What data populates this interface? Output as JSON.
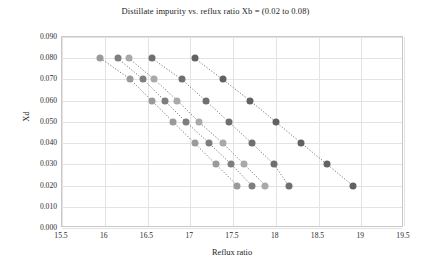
{
  "chart_data": {
    "type": "scatter",
    "title": "Distillate impurity vs. reflux ratio Xb = (0.02 to 0.08)",
    "xlabel": "Reflux ratio",
    "ylabel": "Xd",
    "xlim": [
      15.5,
      19.5
    ],
    "ylim": [
      0.0,
      0.09
    ],
    "xticks": [
      "15.5",
      "16",
      "16.5",
      "17",
      "17.5",
      "18",
      "18.5",
      "19",
      "19.5"
    ],
    "xtick_values": [
      15.5,
      16,
      16.5,
      17,
      17.5,
      18,
      18.5,
      19,
      19.5
    ],
    "yticks": [
      "0.000",
      "0.010",
      "0.020",
      "0.030",
      "0.040",
      "0.050",
      "0.060",
      "0.070",
      "0.080",
      "0.090"
    ],
    "ytick_values": [
      0.0,
      0.01,
      0.02,
      0.03,
      0.04,
      0.05,
      0.06,
      0.07,
      0.08,
      0.09
    ],
    "grid": true,
    "legend": "none",
    "marker": "circle",
    "line_style": "dotted",
    "series": [
      {
        "name": "Xb = 0.02",
        "color": "#9a9a9a",
        "x": [
          15.95,
          16.3,
          16.55,
          16.8,
          17.05,
          17.3,
          17.55
        ],
        "y": [
          0.08,
          0.07,
          0.06,
          0.05,
          0.04,
          0.03,
          0.02
        ]
      },
      {
        "name": "Xb = 0.035",
        "color": "#7e7e7e",
        "x": [
          16.15,
          16.45,
          16.7,
          16.95,
          17.22,
          17.48,
          17.72
        ],
        "y": [
          0.08,
          0.07,
          0.06,
          0.05,
          0.04,
          0.03,
          0.02
        ]
      },
      {
        "name": "Xb = 0.05",
        "color": "#a9a9a9",
        "x": [
          16.28,
          16.58,
          16.85,
          17.1,
          17.38,
          17.63,
          17.88
        ],
        "y": [
          0.08,
          0.07,
          0.06,
          0.05,
          0.04,
          0.03,
          0.02
        ]
      },
      {
        "name": "Xb = 0.065",
        "color": "#6f6f6f",
        "x": [
          16.55,
          16.9,
          17.18,
          17.45,
          17.72,
          17.98,
          18.15
        ],
        "y": [
          0.08,
          0.07,
          0.06,
          0.05,
          0.04,
          0.03,
          0.02
        ]
      },
      {
        "name": "Xb = 0.08",
        "color": "#5f6366",
        "x": [
          17.05,
          17.38,
          17.7,
          18.0,
          18.3,
          18.6,
          18.9
        ],
        "y": [
          0.08,
          0.07,
          0.06,
          0.05,
          0.04,
          0.03,
          0.02
        ]
      }
    ]
  }
}
